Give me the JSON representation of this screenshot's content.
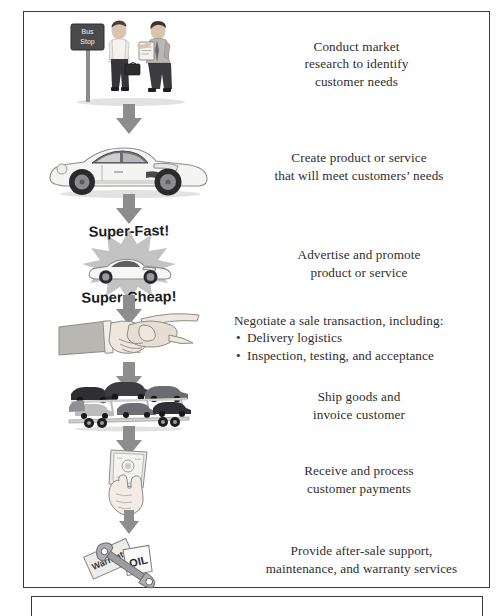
{
  "document": {
    "title": "Sales process flow diagram",
    "frame_color": "#3a3a3a",
    "arrow_color": "#8d8d8d",
    "text_color": "#2e2e2e"
  },
  "flow": {
    "steps": [
      {
        "id": "market-research",
        "illustration": "two-businessmen-at-bus-stop",
        "illustration_labels": [
          "Bus",
          "Stop"
        ],
        "caption_align": "center",
        "caption_lines": [
          "Conduct market",
          "research to identify",
          "customer needs"
        ]
      },
      {
        "id": "create-product",
        "illustration": "white-sports-car",
        "illustration_labels": [],
        "caption_align": "center",
        "caption_lines": [
          "Create product or service",
          "that will meet customers’ needs"
        ]
      },
      {
        "id": "advertise",
        "illustration": "car-advertisement-starburst",
        "illustration_labels": [
          "Super-Fast!",
          "Super-Cheap!"
        ],
        "caption_align": "center",
        "caption_lines": [
          "Advertise and promote",
          "product or service"
        ]
      },
      {
        "id": "negotiate",
        "illustration": "handshake",
        "illustration_labels": [],
        "caption_align": "left",
        "caption_lines": [
          "Negotiate a sale transaction, including:"
        ],
        "caption_bullets": [
          "Delivery logistics",
          "Inspection, testing, and acceptance"
        ]
      },
      {
        "id": "ship-invoice",
        "illustration": "car-carrier-transport-truck",
        "illustration_labels": [],
        "caption_align": "center",
        "caption_lines": [
          "Ship goods and",
          "invoice customer"
        ]
      },
      {
        "id": "receive-payment",
        "illustration": "hand-holding-money",
        "illustration_labels": [],
        "caption_align": "center",
        "caption_lines": [
          "Receive and process",
          "customer payments"
        ]
      },
      {
        "id": "after-sale-support",
        "illustration": "warranty-oil-wrench",
        "illustration_labels": [
          "Warranty",
          "OIL"
        ],
        "caption_align": "center",
        "caption_lines": [
          "Provide after-sale support,",
          "maintenance, and warranty services"
        ]
      }
    ],
    "connector_count": 6,
    "connector_name": "down-arrow"
  }
}
